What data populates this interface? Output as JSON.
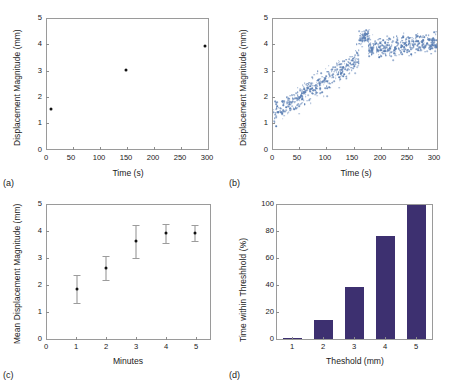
{
  "figure": {
    "panels": [
      {
        "id": "a",
        "letter": "(a)"
      },
      {
        "id": "b",
        "letter": "(b)"
      },
      {
        "id": "c",
        "letter": "(c)"
      },
      {
        "id": "d",
        "letter": "(d)"
      }
    ]
  },
  "colors": {
    "scatter": "#5b7fb4",
    "marker": "#111111",
    "bar": "#3d3070",
    "axis": "#9a9a9a",
    "errorbar": "#8e8e8e"
  },
  "chart_data": [
    {
      "type": "scatter",
      "panel": "a",
      "title": "",
      "xlabel": "Time (s)",
      "ylabel": "Displacement Magnitude (mm)",
      "xlim": [
        0,
        305
      ],
      "ylim": [
        0,
        5
      ],
      "xticks": [
        0,
        50,
        100,
        150,
        200,
        250,
        300
      ],
      "yticks": [
        0,
        1,
        2,
        3,
        4,
        5
      ],
      "grid": false,
      "legend": "none",
      "x": [
        5,
        150,
        300
      ],
      "y": [
        1.55,
        3.05,
        3.95
      ]
    },
    {
      "type": "scatter",
      "panel": "b",
      "title": "",
      "xlabel": "Time (s)",
      "ylabel": "Displacement Magnitude (mm)",
      "xlim": [
        0,
        305
      ],
      "ylim": [
        0,
        5
      ],
      "xticks": [
        0,
        50,
        100,
        150,
        200,
        250,
        300
      ],
      "yticks": [
        0,
        1,
        2,
        3,
        4,
        5
      ],
      "grid": false,
      "legend": "none",
      "description": "Dense blue scatter: rising trend from ~1.3 mm at 0 s to ~3.5 mm at 160 s, a tight high cluster peaking ~4.6 mm near 170 s, then a noisy plateau around 4.0 mm out to 305 s.",
      "segments": [
        {
          "x_range": [
            0,
            160
          ],
          "y_start": 1.35,
          "y_end": 3.45,
          "spread": 0.45,
          "n": 430
        },
        {
          "x_range": [
            160,
            180
          ],
          "y_start": 4.25,
          "y_end": 4.35,
          "spread": 0.28,
          "n": 70
        },
        {
          "x_range": [
            178,
            305
          ],
          "y_start": 3.85,
          "y_end": 4.1,
          "spread": 0.38,
          "n": 400
        }
      ]
    },
    {
      "type": "scatter",
      "panel": "c",
      "title": "",
      "xlabel": "Minutes",
      "ylabel": "Mean Displacement Magnitude (mm)",
      "xlim": [
        0,
        5.5
      ],
      "ylim": [
        0,
        5
      ],
      "xticks": [
        0,
        1,
        2,
        3,
        4,
        5
      ],
      "yticks": [
        0,
        1,
        2,
        3,
        4,
        5
      ],
      "grid": false,
      "legend": "none",
      "errorbars": true,
      "x": [
        1,
        2,
        3,
        4,
        5
      ],
      "y": [
        1.85,
        2.65,
        3.65,
        3.95,
        3.97
      ],
      "yerr": [
        0.52,
        0.45,
        0.62,
        0.35,
        0.3
      ]
    },
    {
      "type": "bar",
      "panel": "d",
      "title": "",
      "xlabel": "Theshold (mm)",
      "ylabel": "Time within Threshhold (%)",
      "categories": [
        "1",
        "2",
        "3",
        "4",
        "5"
      ],
      "values": [
        1,
        14,
        39,
        77,
        100
      ],
      "xlim": [
        0.5,
        5.5
      ],
      "ylim": [
        0,
        100
      ],
      "yticks": [
        0,
        20,
        40,
        60,
        80,
        100
      ],
      "xticks": [
        1,
        2,
        3,
        4,
        5
      ],
      "grid": false,
      "legend": "none"
    }
  ]
}
